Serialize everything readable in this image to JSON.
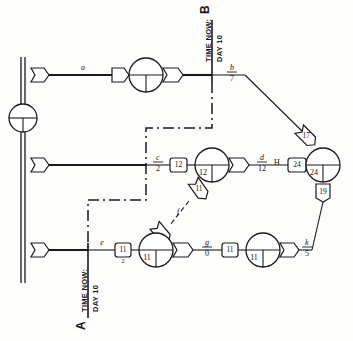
{
  "diagram": {
    "type": "network-schedule",
    "markers": {
      "top": {
        "letter": "B",
        "line1": "TIME NOW:",
        "line2": "DAY 10"
      },
      "bottom": {
        "letter": "A",
        "line1": "TIME NOW:",
        "line2": "DAY 10"
      }
    },
    "rows": {
      "top": {
        "activity_label": "a",
        "circle_value": "",
        "end_label_id": "b",
        "end_label_num": "7"
      },
      "middle": {
        "start_label_id": "c",
        "start_label_num": "2",
        "box_before": "12",
        "circle_value": "12",
        "activity_label_id": "d",
        "activity_label_num": "12",
        "hash_mark": "H",
        "box_after": "24",
        "circle_right_value": "24",
        "drop_box": "19"
      },
      "bottom": {
        "start_label": "e",
        "box_left": "11",
        "box_left_sub": "2",
        "circle_left_value": "11",
        "activity_label_id": "g",
        "activity_label_num": "0",
        "box_right": "11",
        "circle_right_value": "11",
        "end_label_id": "k",
        "end_label_num": "5"
      }
    },
    "connectors": {
      "diagonal_top_right": "17",
      "diagonal_mid_bottom": "11",
      "diagonal_mid_bottom_label": "f"
    },
    "colors": {
      "ink": "#1a1a1a",
      "paper": "#fdfdfc"
    }
  }
}
